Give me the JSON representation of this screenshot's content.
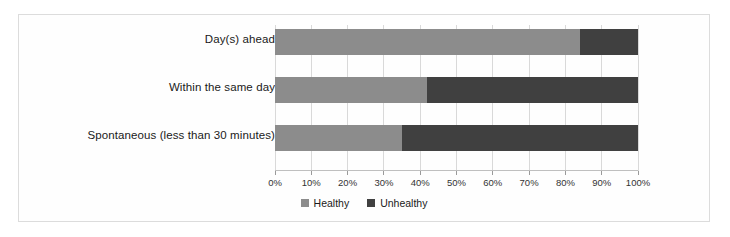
{
  "chart_data": {
    "type": "bar",
    "orientation": "horizontal",
    "stacked": true,
    "stack_mode": "percent",
    "title": "",
    "subtitle": "",
    "xlabel": "",
    "ylabel": "",
    "xlim": [
      0,
      100
    ],
    "grid": true,
    "legend_position": "bottom",
    "categories": [
      "Day(s) ahead",
      "Within the same day",
      "Spontaneous (less than 30 minutes)"
    ],
    "xticks": [
      "0%",
      "10%",
      "20%",
      "30%",
      "40%",
      "50%",
      "60%",
      "70%",
      "80%",
      "90%",
      "100%"
    ],
    "xtick_values": [
      0,
      10,
      20,
      30,
      40,
      50,
      60,
      70,
      80,
      90,
      100
    ],
    "series": [
      {
        "name": "Healthy",
        "color": "#8c8c8c",
        "values": [
          84,
          42,
          35
        ]
      },
      {
        "name": "Unhealthy",
        "color": "#404040",
        "values": [
          16,
          58,
          65
        ]
      }
    ]
  },
  "legend": {
    "items": [
      {
        "label": "Healthy",
        "color": "#8c8c8c"
      },
      {
        "label": "Unhealthy",
        "color": "#404040"
      }
    ]
  }
}
